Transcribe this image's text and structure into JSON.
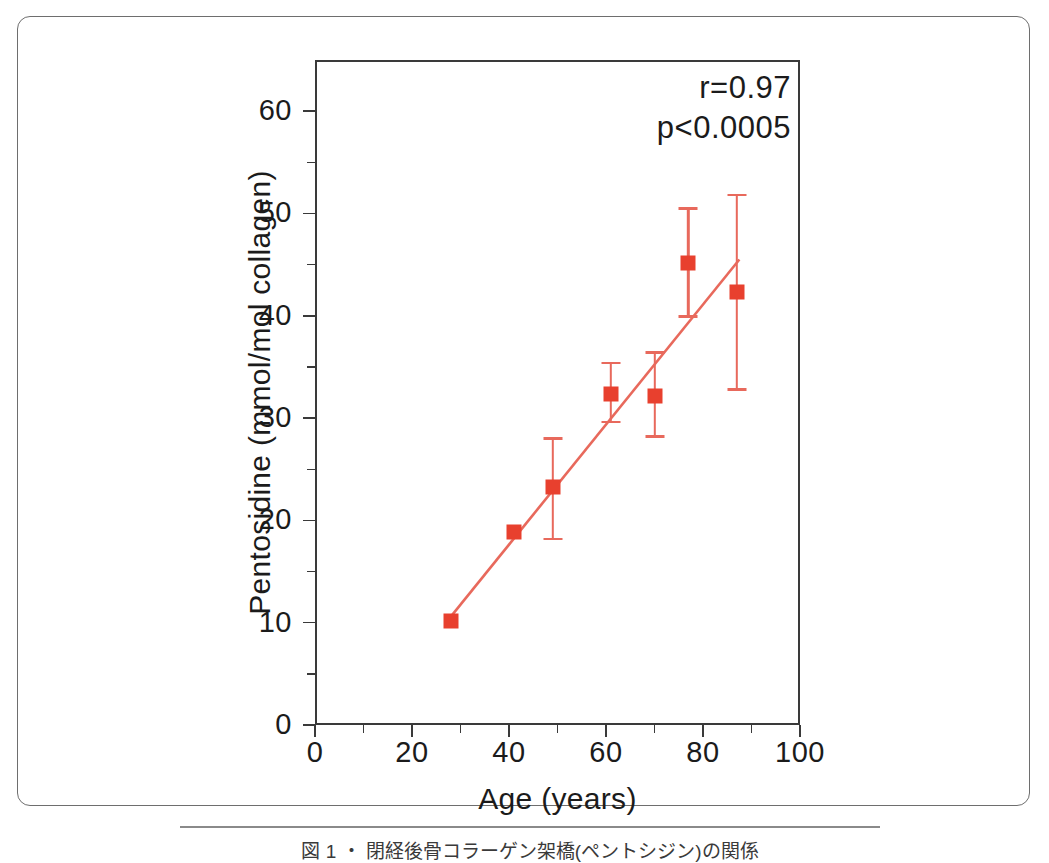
{
  "figure": {
    "caption": "図 1 ・ 閉経後骨コラーゲン架橋(ペントシジン)の関係",
    "border_color": "#6e6e6e",
    "background": "#ffffff"
  },
  "chart_data": {
    "type": "scatter",
    "title": "",
    "xlabel": "Age (years)",
    "ylabel": "Pentosidine (mmol/mol collagen)",
    "xlim": [
      0,
      100
    ],
    "ylim": [
      0,
      65
    ],
    "grid": false,
    "legend": "none",
    "marker_color": "#e8402e",
    "line_color": "#e8695c",
    "errorbar_color": "#e8695c",
    "xticks_major": [
      0,
      20,
      40,
      60,
      80,
      100
    ],
    "xticks_minor": [
      10,
      30,
      50,
      70,
      90
    ],
    "yticks_major": [
      0,
      10,
      20,
      30,
      40,
      50,
      60
    ],
    "yticks_minor": [
      5,
      15,
      25,
      35,
      45,
      55
    ],
    "xtick_labels": [
      "0",
      "20",
      "40",
      "60",
      "80",
      "100"
    ],
    "ytick_labels": [
      "0",
      "10",
      "20",
      "30",
      "40",
      "50",
      "60"
    ],
    "x": [
      28,
      41,
      49,
      61,
      70,
      77,
      87
    ],
    "y": [
      10.2,
      18.9,
      23.3,
      32.4,
      32.2,
      45.2,
      42.3
    ],
    "yerr_low": [
      null,
      null,
      18.2,
      29.6,
      28.2,
      39.9,
      32.8
    ],
    "yerr_high": [
      null,
      null,
      28.0,
      35.4,
      36.4,
      50.5,
      51.8
    ],
    "points": [
      {
        "age": 28,
        "pentosidine": 10.2,
        "err_low": null,
        "err_high": null,
        "has_errorbar": false
      },
      {
        "age": 41,
        "pentosidine": 18.9,
        "err_low": null,
        "err_high": null,
        "has_errorbar": false
      },
      {
        "age": 49,
        "pentosidine": 23.3,
        "err_low": 18.2,
        "err_high": 28.0,
        "has_errorbar": true
      },
      {
        "age": 61,
        "pentosidine": 32.4,
        "err_low": 29.6,
        "err_high": 35.4,
        "has_errorbar": true
      },
      {
        "age": 70,
        "pentosidine": 32.2,
        "err_low": 28.2,
        "err_high": 36.4,
        "has_errorbar": true
      },
      {
        "age": 77,
        "pentosidine": 45.2,
        "err_low": 39.9,
        "err_high": 50.5,
        "has_errorbar": true
      },
      {
        "age": 87,
        "pentosidine": 42.3,
        "err_low": 32.8,
        "err_high": 51.8,
        "has_errorbar": true
      }
    ],
    "regression": {
      "x_start": 27.5,
      "y_start": 10.3,
      "x_end": 87.5,
      "y_end": 45.5
    },
    "annotations": {
      "correlation": "r=0.97",
      "pvalue": "p<0.0005"
    }
  }
}
